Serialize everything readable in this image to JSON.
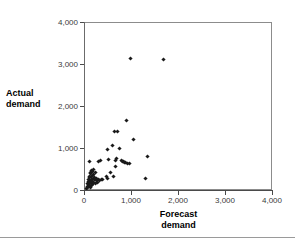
{
  "chart_data": {
    "type": "scatter",
    "title": "",
    "xlabel": "Forecast demand",
    "ylabel": "Actual demand",
    "xlim": [
      0,
      4000
    ],
    "ylim": [
      0,
      4000
    ],
    "xticks": [
      0,
      1000,
      2000,
      3000,
      4000
    ],
    "yticks": [
      0,
      1000,
      2000,
      3000,
      4000
    ],
    "xticklabels": [
      "0",
      "1,000",
      "2,000",
      "3,000",
      "4,000"
    ],
    "yticklabels": [
      "0",
      "1,000",
      "2,000",
      "3,000",
      "4,000"
    ],
    "grid": false,
    "legend": null,
    "marker": "diamond",
    "marker_color": "#1a1a1a",
    "series": [
      {
        "name": "Forecast vs actual demand",
        "points": [
          [
            60,
            40
          ],
          [
            70,
            90
          ],
          [
            80,
            150
          ],
          [
            85,
            60
          ],
          [
            90,
            200
          ],
          [
            95,
            120
          ],
          [
            100,
            250
          ],
          [
            105,
            80
          ],
          [
            110,
            300
          ],
          [
            115,
            170
          ],
          [
            120,
            330
          ],
          [
            125,
            110
          ],
          [
            130,
            390
          ],
          [
            135,
            230
          ],
          [
            140,
            70
          ],
          [
            145,
            420
          ],
          [
            150,
            260
          ],
          [
            155,
            150
          ],
          [
            160,
            470
          ],
          [
            165,
            320
          ],
          [
            170,
            100
          ],
          [
            175,
            350
          ],
          [
            180,
            200
          ],
          [
            185,
            430
          ],
          [
            190,
            130
          ],
          [
            195,
            280
          ],
          [
            200,
            500
          ],
          [
            205,
            180
          ],
          [
            210,
            380
          ],
          [
            215,
            240
          ],
          [
            120,
            690
          ],
          [
            230,
            300
          ],
          [
            240,
            160
          ],
          [
            250,
            420
          ],
          [
            260,
            230
          ],
          [
            270,
            270
          ],
          [
            290,
            190
          ],
          [
            300,
            690
          ],
          [
            310,
            250
          ],
          [
            330,
            230
          ],
          [
            360,
            700
          ],
          [
            380,
            260
          ],
          [
            400,
            250
          ],
          [
            470,
            330
          ],
          [
            490,
            960
          ],
          [
            500,
            280
          ],
          [
            520,
            720
          ],
          [
            560,
            420
          ],
          [
            600,
            1060
          ],
          [
            620,
            320
          ],
          [
            640,
            1400
          ],
          [
            660,
            700
          ],
          [
            680,
            560
          ],
          [
            700,
            760
          ],
          [
            720,
            1400
          ],
          [
            760,
            1000
          ],
          [
            790,
            700
          ],
          [
            820,
            690
          ],
          [
            840,
            670
          ],
          [
            860,
            660
          ],
          [
            880,
            650
          ],
          [
            900,
            1660
          ],
          [
            930,
            640
          ],
          [
            960,
            630
          ],
          [
            980,
            3120
          ],
          [
            1060,
            1200
          ],
          [
            1300,
            270
          ],
          [
            1350,
            790
          ],
          [
            1700,
            3100
          ]
        ]
      }
    ]
  },
  "axes": {
    "y_title_lines": [
      "Actual",
      "demand"
    ],
    "x_title_lines": [
      "Forecast",
      "demand"
    ]
  }
}
